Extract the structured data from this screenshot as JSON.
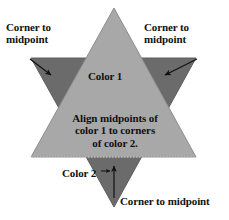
{
  "figure": {
    "background_color": "#ffffff",
    "colors": {
      "color_1_fill": "#a8a8a8",
      "color_2_fill": "#6b6b6b",
      "outline": "#8f8f8f",
      "text": "#111111",
      "arrow": "#111111"
    },
    "shapes": {
      "color_1_triangle": {
        "name": "upward-triangle",
        "fill": "#a8a8a8",
        "points": "114,8 196,157 31,157"
      },
      "color_2_triangle": {
        "name": "downward-triangle",
        "fill": "#6b6b6b",
        "points": "31,58 196,58 114,207"
      }
    },
    "annotations": {
      "corner_to_midpoint_left": "Corner to\nmidpoint",
      "corner_to_midpoint_right": "Corner to\nmidpoint",
      "corner_to_midpoint_bottom": "Corner to midpoint",
      "color_1": "Color 1",
      "color_2": "Color 2",
      "align_note": "Align midpoints of color 1 to corners of color 2."
    },
    "arrows": {
      "left": {
        "x1": 30,
        "y1": 59,
        "x2": 53,
        "y2": 76
      },
      "right": {
        "x1": 197,
        "y1": 59,
        "x2": 163,
        "y2": 76
      },
      "bottom_vertical": {
        "x1": 114,
        "y1": 197,
        "x2": 114,
        "y2": 164
      },
      "color_2_pointer": {
        "x1": 104,
        "y1": 172,
        "x2": 112,
        "y2": 172
      }
    }
  },
  "labels": {
    "corner_to_midpoint_left_line1": "Corner to",
    "corner_to_midpoint_left_line2": "midpoint",
    "corner_to_midpoint_right_line1": "Corner to",
    "corner_to_midpoint_right_line2": "midpoint",
    "color_1": "Color 1",
    "align_line1": "Align midpoints of",
    "align_line2": "color 1 to corners",
    "align_line3": "of color 2.",
    "color_2": "Color 2",
    "corner_to_midpoint_bottom": "Corner to midpoint"
  }
}
